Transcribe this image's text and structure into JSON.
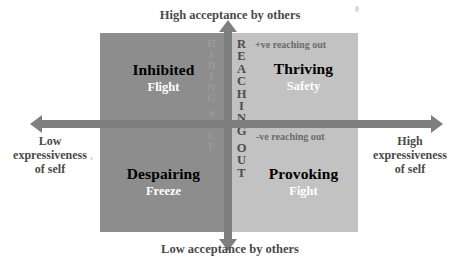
{
  "diagram": {
    "axes": {
      "top_label": "High acceptance by others",
      "bottom_label": "Low acceptance by others",
      "left_label": "Low\nexpressiveness\nof self",
      "left_label_lines": [
        "Low",
        "expressiveness",
        "of self"
      ],
      "right_label": "High\nexpressiveness\nof self",
      "right_label_lines": [
        "High",
        "expressiveness",
        "of self"
      ],
      "axis_color": "#7f7f7f",
      "label_color": "#4a4a4a"
    },
    "spines": {
      "left_word": "HIDING SELF",
      "left_letters": [
        "H",
        "I",
        "D",
        "I",
        "N",
        "G",
        "",
        "S",
        "E",
        "L",
        "F"
      ],
      "left_color": "#9a9a9a",
      "right_word": "REACHING OUT",
      "right_letters": [
        "R",
        "E",
        "A",
        "C",
        "H",
        "I",
        "N",
        "G",
        "",
        "O",
        "U",
        "T"
      ],
      "right_color": "#4d4d4d"
    },
    "notes": {
      "positive": "+ve reaching out",
      "negative": "-ve reaching out",
      "note_color": "#6b6b6b"
    },
    "quadrants": [
      {
        "id": "inhibited",
        "title": "Inhibited",
        "subtitle": "Flight",
        "position": "top-left",
        "fill": "#8d8d8d",
        "title_color": "#000000",
        "subtitle_color": "#ffffff"
      },
      {
        "id": "thriving",
        "title": "Thriving",
        "subtitle": "Safety",
        "position": "top-right",
        "fill": "#c2c2c2",
        "title_color": "#000000",
        "subtitle_color": "#ffffff"
      },
      {
        "id": "despairing",
        "title": "Despairing",
        "subtitle": "Freeze",
        "position": "bottom-left",
        "fill": "#8d8d8d",
        "title_color": "#000000",
        "subtitle_color": "#ffffff"
      },
      {
        "id": "provoking",
        "title": "Provoking",
        "subtitle": "Fight",
        "position": "bottom-right",
        "fill": "#c2c2c2",
        "title_color": "#000000",
        "subtitle_color": "#ffffff"
      }
    ]
  }
}
